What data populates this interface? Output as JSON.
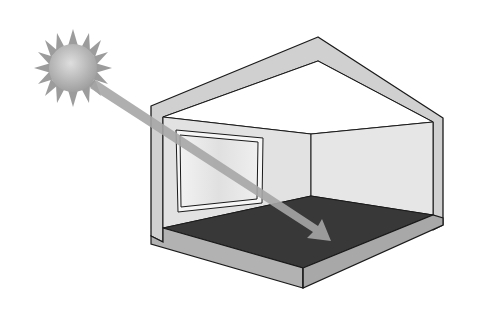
{
  "figure": {
    "elements": [
      {
        "name": "sun",
        "icon": "sun-icon"
      },
      {
        "name": "light-ray-arrow",
        "icon": "arrow-icon"
      },
      {
        "name": "house-cutaway",
        "icon": "house-icon"
      },
      {
        "name": "window",
        "icon": "window-icon"
      },
      {
        "name": "dark-floor",
        "icon": "floor-icon"
      }
    ]
  },
  "colors": {
    "background": "#ffffff",
    "sun_fill": "#b8b8b8",
    "sun_rays": "#9a9a9a",
    "ray": "#a8a8a8",
    "wall_section": "#d2d2d2",
    "inner_wall": "#e4e4e4",
    "window_glass": "#ececec",
    "floor": "#3a3a3a",
    "base": "#b4b4b4",
    "outline": "#1a1a1a"
  }
}
